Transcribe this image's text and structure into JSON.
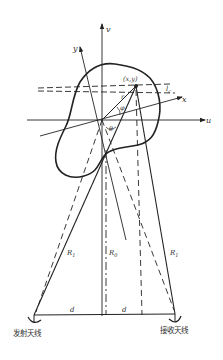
{
  "diagram": {
    "type": "radar imaging geometry (bistatic)",
    "axes": {
      "v": "v",
      "u": "u",
      "y": "y",
      "x": "x"
    },
    "labels": {
      "point": "(x,y)",
      "r": "r",
      "phi": "φ",
      "theta": "θ",
      "lc": "l",
      "lc_sub": "c",
      "R1_left": "R",
      "R1_left_sub": "1",
      "R0": "R",
      "R0_sub": "0",
      "R1_right": "R",
      "R1_right_sub": "1",
      "d_left": "d",
      "d_right": "d"
    },
    "antennas": {
      "transmit": "发射天线",
      "receive": "接收天线"
    },
    "colors": {
      "ink": "#222222",
      "background": "#ffffff"
    }
  }
}
